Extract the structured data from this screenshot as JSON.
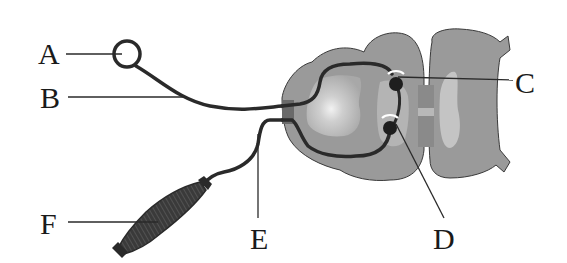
{
  "diagram": {
    "type": "reflex-arc",
    "labels": {
      "A": "A",
      "B": "B",
      "C": "C",
      "D": "D",
      "E": "E",
      "F": "F"
    },
    "parts": [
      {
        "id": "A",
        "depicts": "receptor (ring ending)"
      },
      {
        "id": "B",
        "depicts": "afferent nerve fiber"
      },
      {
        "id": "C",
        "depicts": "synapse / neuron body in gray matter (upper)"
      },
      {
        "id": "D",
        "depicts": "synapse / neuron body in gray matter (lower)"
      },
      {
        "id": "E",
        "depicts": "efferent nerve fiber"
      },
      {
        "id": "F",
        "depicts": "effector (muscle)"
      }
    ],
    "colors": {
      "outline": "#333333",
      "nerve": "#2a2a2a",
      "spinal_cord": "#9a9a9a",
      "gray_matter_light": "#c4c4c4",
      "ganglion_highlight": "#e6e6e6",
      "muscle": "#3a3a3a",
      "text": "#1a1a1a"
    }
  }
}
